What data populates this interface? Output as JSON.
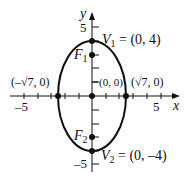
{
  "diagram": {
    "type": "ellipse-graph",
    "axes": {
      "x_label": "x",
      "y_label": "y",
      "x_ticks": {
        "neg": "–5",
        "pos": "5"
      },
      "y_ticks": {
        "pos": "5",
        "neg": "–5"
      }
    },
    "points": {
      "v1": {
        "name": "V",
        "sub": "1",
        "coords": " = (0, 4)"
      },
      "v2": {
        "name": "V",
        "sub": "2",
        "coords": " = (0, –4)"
      },
      "f1": {
        "name": "F",
        "sub": "1"
      },
      "f2": {
        "name": "F",
        "sub": "2"
      },
      "left": {
        "label": "(–√7, 0)"
      },
      "right": {
        "label": "(√7, 0)"
      },
      "center": {
        "label": "(0, 0)"
      }
    },
    "colors": {
      "stroke": "#111111",
      "background": "#ffffff"
    }
  }
}
